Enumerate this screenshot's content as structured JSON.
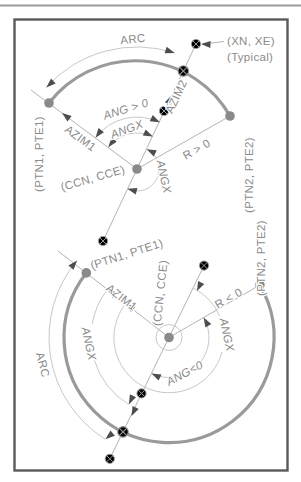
{
  "figure": "arc-azimuth-geometry-diagram",
  "colors": {
    "thick_arc": "#9a9a9a",
    "thin_line": "#b4b4b4",
    "dim_arc": "#c8c8c8",
    "text": "#8a8a8a",
    "arrow": "#4d4d4d",
    "frame": "#5a5a5a",
    "background": "#ffffff"
  },
  "top": {
    "arc": "ARC",
    "xn_xe": "(XN, XE)",
    "typical": "(Typical)",
    "ang_pos": "ANG > 0",
    "angx_upper": "ANGX",
    "angx_reflex": "ANGX",
    "azim1": "AZIM1",
    "azim2": "AZIM2",
    "r_pos": "R > 0",
    "ccn": "(CCN, CCE)",
    "ptn1": "(PTN1, PTE1)",
    "ptn2": "(PTN2, PTE2)"
  },
  "bottom": {
    "arc": "ARC",
    "angx_left": "ANGX",
    "angx_right": "ANGX",
    "azim1": "AZIM1",
    "r_neg": "R < 0",
    "ang_neg": "ANG<0",
    "ccn": "(CCN, CCE)",
    "ptn1": "(PTN1, PTE1)",
    "ptn2": "(PTN2, PTE2)"
  }
}
